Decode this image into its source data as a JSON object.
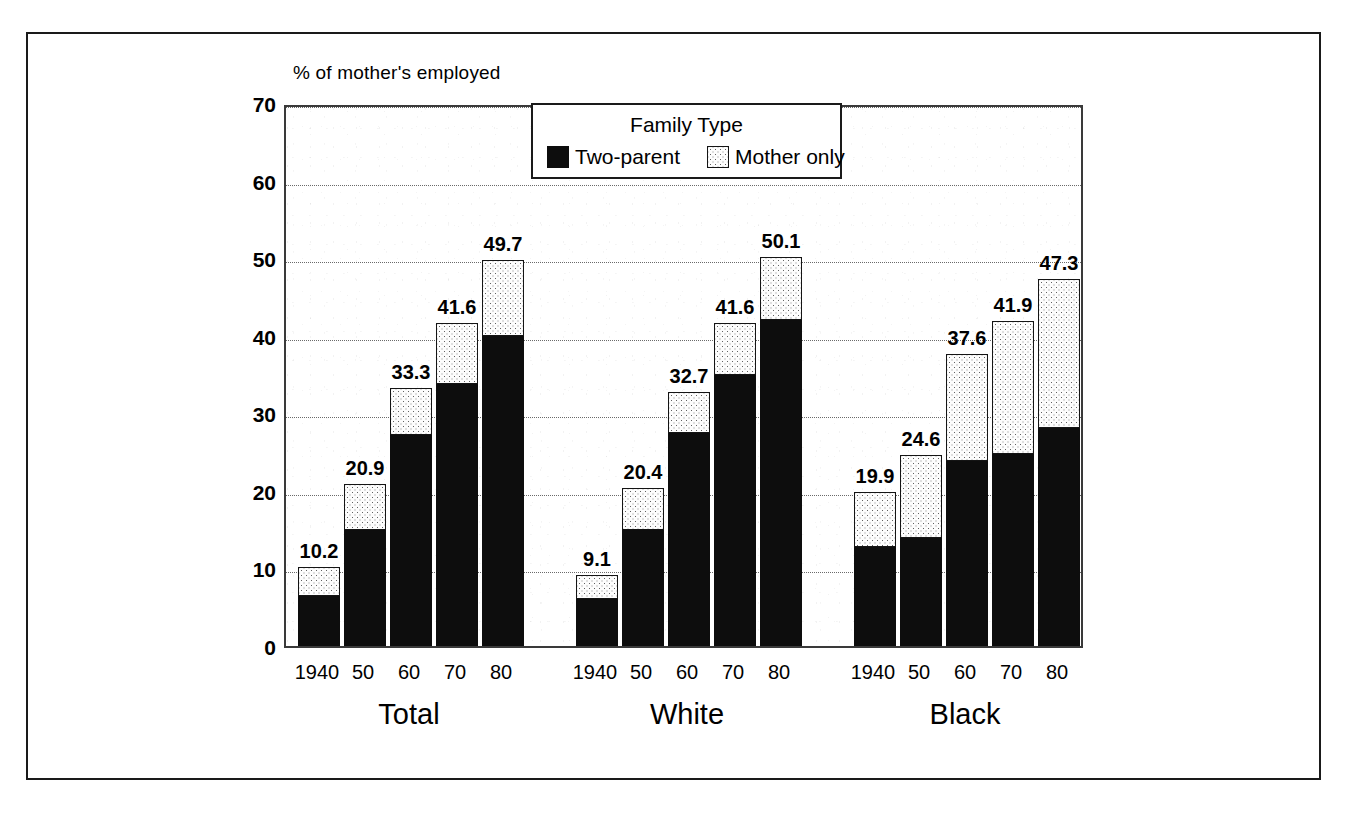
{
  "chart_data": {
    "type": "bar",
    "subtype": "stacked-bar-grouped",
    "title": "",
    "ylabel": "% of mother's employed",
    "xlabel": "",
    "ylim": [
      0,
      70
    ],
    "yticks": [
      0,
      10,
      20,
      30,
      40,
      50,
      60,
      70
    ],
    "ytick_labels": [
      "0",
      "10",
      "20",
      "30",
      "40",
      "50",
      "60",
      "70"
    ],
    "grid": true,
    "grid_style": "dotted-horizontal",
    "legend": {
      "title": "Family Type",
      "position": "top-center-inside",
      "entries": [
        {
          "label": "Two-parent",
          "swatch": "solid-black",
          "color": "#0d0d0d"
        },
        {
          "label": "Mother only",
          "swatch": "stippled-light",
          "color": "#fdfdfd"
        }
      ]
    },
    "groups": [
      "Total",
      "White",
      "Black"
    ],
    "categories": [
      "1940",
      "50",
      "60",
      "70",
      "80"
    ],
    "series": [
      {
        "name": "Two-parent",
        "values": {
          "Total": [
            6.4,
            15.0,
            27.2,
            33.8,
            40.0
          ],
          "White": [
            6.1,
            15.0,
            27.5,
            35.0,
            42.0
          ],
          "Black": [
            12.8,
            13.9,
            23.9,
            24.8,
            28.1
          ]
        }
      },
      {
        "name": "Mother only",
        "values": {
          "Total": [
            3.8,
            5.9,
            6.1,
            7.8,
            9.7
          ],
          "White": [
            3.0,
            5.4,
            5.2,
            6.6,
            8.1
          ],
          "Black": [
            7.1,
            10.7,
            13.7,
            17.1,
            19.2
          ]
        }
      }
    ],
    "totals": {
      "Total": [
        10.2,
        20.9,
        33.3,
        41.6,
        49.7
      ],
      "White": [
        9.1,
        20.4,
        32.7,
        41.6,
        50.1
      ],
      "Black": [
        19.9,
        24.6,
        37.6,
        41.9,
        47.3
      ]
    },
    "total_labels": {
      "Total": [
        "10.2",
        "20.9",
        "33.3",
        "41.6",
        "49.7"
      ],
      "White": [
        "9.1",
        "20.4",
        "32.7",
        "41.6",
        "50.1"
      ],
      "Black": [
        "19.9",
        "24.6",
        "37.6",
        "41.9",
        "47.3"
      ]
    },
    "colors": {
      "two_parent": "#0d0d0d",
      "mother_only": "#fdfdfd",
      "axis": "#1a1a1a",
      "grid": "#6a6a6a",
      "background": "#ffffff"
    }
  }
}
